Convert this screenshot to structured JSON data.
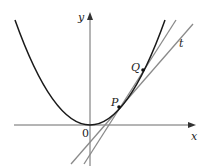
{
  "diagram": {
    "type": "function-graph",
    "axes": {
      "x_label": "x",
      "y_label": "y",
      "origin_label": "0"
    },
    "curve": {
      "kind": "parabola",
      "color": "#1a1a1a"
    },
    "points": [
      {
        "label": "P"
      },
      {
        "label": "Q"
      }
    ],
    "lines": [
      {
        "label": "t",
        "kind": "tangent",
        "through": "P",
        "color": "#8a8a8a"
      },
      {
        "label": "",
        "kind": "secant",
        "through": [
          "P",
          "Q"
        ],
        "color": "#8a8a8a"
      }
    ]
  }
}
